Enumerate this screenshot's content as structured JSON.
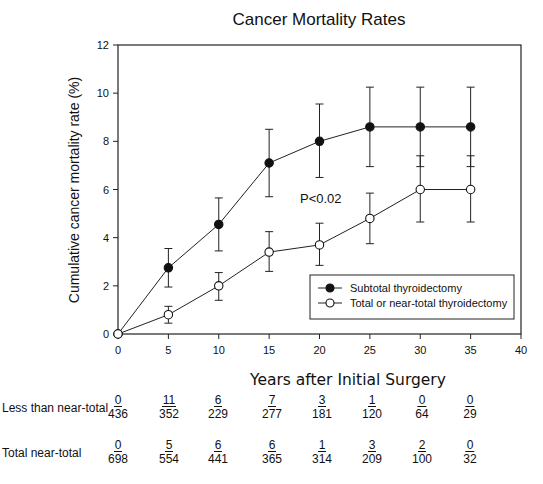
{
  "chart_data": {
    "type": "line",
    "title": "Cancer Mortality Rates",
    "xlabel": "Years after Initial Surgery",
    "ylabel": "Cumulative cancer mortality rate (%)",
    "xlim": [
      0,
      40
    ],
    "ylim": [
      0,
      12
    ],
    "xticks": [
      0,
      5,
      10,
      15,
      20,
      25,
      30,
      35,
      40
    ],
    "yticks": [
      0,
      2,
      4,
      6,
      8,
      10,
      12
    ],
    "grid": false,
    "legend_position": "lower right",
    "annotation": "P<0.02",
    "x": [
      0,
      5,
      10,
      15,
      20,
      25,
      30,
      35
    ],
    "series": [
      {
        "name": "Subtotal thyroidectomy",
        "marker": "filled-circle",
        "values": [
          0,
          2.75,
          4.55,
          7.1,
          8.0,
          8.6,
          8.6,
          8.6
        ],
        "err_low": [
          0,
          1.95,
          3.45,
          5.7,
          6.5,
          6.95,
          6.95,
          6.95
        ],
        "err_high": [
          0,
          3.55,
          5.65,
          8.5,
          9.55,
          10.25,
          10.25,
          10.25
        ]
      },
      {
        "name": "Total or near-total thyroidectomy",
        "marker": "open-circle",
        "values": [
          0,
          0.8,
          2.0,
          3.4,
          3.7,
          4.8,
          6.0,
          6.0
        ],
        "err_low": [
          0,
          0.45,
          1.4,
          2.6,
          2.85,
          3.75,
          4.65,
          4.65
        ],
        "err_high": [
          0,
          1.15,
          2.55,
          4.25,
          4.6,
          5.85,
          7.4,
          7.4
        ]
      }
    ]
  },
  "risk_table": {
    "rows": [
      {
        "label": "Less than near-total",
        "cells": [
          {
            "num": "0",
            "den": "436"
          },
          {
            "num": "11",
            "den": "352"
          },
          {
            "num": "6",
            "den": "229"
          },
          {
            "num": "7",
            "den": "277"
          },
          {
            "num": "3",
            "den": "181"
          },
          {
            "num": "1",
            "den": "120"
          },
          {
            "num": "0",
            "den": "64"
          },
          {
            "num": "0",
            "den": "29"
          }
        ]
      },
      {
        "label": "Total near-total",
        "cells": [
          {
            "num": "0",
            "den": "698"
          },
          {
            "num": "5",
            "den": "554"
          },
          {
            "num": "6",
            "den": "441"
          },
          {
            "num": "6",
            "den": "365"
          },
          {
            "num": "1",
            "den": "314"
          },
          {
            "num": "3",
            "den": "209"
          },
          {
            "num": "2",
            "den": "100"
          },
          {
            "num": "0",
            "den": "32"
          }
        ]
      }
    ]
  }
}
